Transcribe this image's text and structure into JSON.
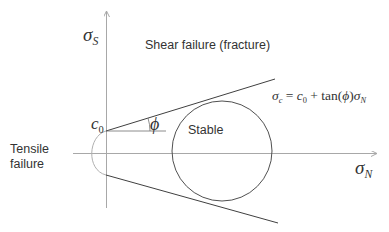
{
  "diagram": {
    "type": "mohr_coulomb_failure_envelope",
    "axes": {
      "y_axis_label": {
        "symbol": "σ",
        "subscript": "S"
      },
      "x_axis_label": {
        "symbol": "σ",
        "subscript": "N"
      }
    },
    "regions": {
      "shear_failure": "Shear failure (fracture)",
      "stable": "Stable",
      "tensile_failure_line1": "Tensile",
      "tensile_failure_line2": "failure"
    },
    "intercept_label": {
      "symbol": "c",
      "subscript": "0"
    },
    "angle_label": "ϕ",
    "equation": {
      "lhs_symbol": "σ",
      "lhs_subscript": "c",
      "equals": " = ",
      "c_symbol": "c",
      "c_subscript": "0",
      "plus": " + tan(",
      "phi": "ϕ",
      "close": ")",
      "rhs_symbol": "σ",
      "rhs_subscript": "N"
    },
    "colors": {
      "axis": "#a8a8a8",
      "envelope": "#404040",
      "circle": "#505050",
      "tensile_cap": "#b0b0b0",
      "text": "#333333"
    }
  }
}
